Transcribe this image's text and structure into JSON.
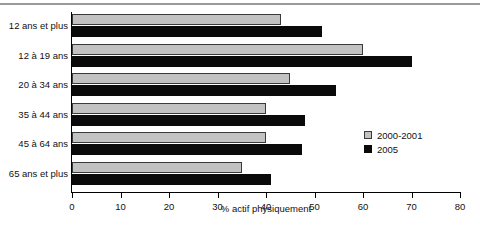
{
  "chart_data": {
    "type": "bar",
    "orientation": "horizontal",
    "title": "",
    "xlabel": "% actif physiquement",
    "ylabel": "",
    "xlim": [
      0,
      80
    ],
    "xticks": [
      0,
      10,
      20,
      30,
      40,
      50,
      60,
      70,
      80
    ],
    "grid": false,
    "legend_position": "center-right",
    "categories": [
      "12 ans et plus",
      "12 à 19 ans",
      "20 à 34 ans",
      "35 à 44 ans",
      "45 à 64 ans",
      "65 ans et plus"
    ],
    "series": [
      {
        "name": "2000-2001",
        "color": "#c2c2c2",
        "values": [
          43,
          60,
          45,
          40,
          40,
          35
        ]
      },
      {
        "name": "2005",
        "color": "#0a0a0a",
        "values": [
          51.5,
          70,
          54.5,
          48,
          47.5,
          41
        ]
      }
    ]
  },
  "legend": {
    "items": [
      {
        "label": "2000-2001"
      },
      {
        "label": "2005"
      }
    ]
  },
  "axis": {
    "tick_labels": [
      "0",
      "10",
      "20",
      "30",
      "40",
      "50",
      "60",
      "70",
      "80"
    ],
    "x_title": "% actif physiquement"
  }
}
